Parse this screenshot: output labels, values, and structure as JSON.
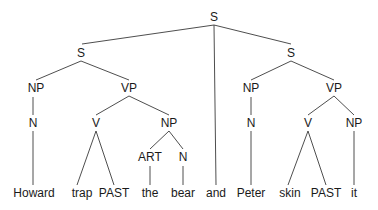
{
  "diagram": {
    "type": "syntax-tree",
    "nodes": [
      {
        "id": "s_root",
        "label": "S",
        "x": 214,
        "y": 21
      },
      {
        "id": "s_left",
        "label": "S",
        "x": 81,
        "y": 57
      },
      {
        "id": "s_right",
        "label": "S",
        "x": 291,
        "y": 57
      },
      {
        "id": "np1",
        "label": "NP",
        "x": 36,
        "y": 92
      },
      {
        "id": "vp1",
        "label": "VP",
        "x": 129,
        "y": 92
      },
      {
        "id": "np3",
        "label": "NP",
        "x": 251,
        "y": 92
      },
      {
        "id": "vp2",
        "label": "VP",
        "x": 334,
        "y": 92
      },
      {
        "id": "n1",
        "label": "N",
        "x": 33,
        "y": 127
      },
      {
        "id": "v1",
        "label": "V",
        "x": 96,
        "y": 127
      },
      {
        "id": "np2",
        "label": "NP",
        "x": 169,
        "y": 127
      },
      {
        "id": "n3",
        "label": "N",
        "x": 251,
        "y": 127
      },
      {
        "id": "v2",
        "label": "V",
        "x": 308,
        "y": 127
      },
      {
        "id": "np4",
        "label": "NP",
        "x": 354,
        "y": 127
      },
      {
        "id": "art",
        "label": "ART",
        "x": 150,
        "y": 161
      },
      {
        "id": "n2",
        "label": "N",
        "x": 183,
        "y": 161
      },
      {
        "id": "w_howard",
        "label": "Howard",
        "x": 34,
        "y": 197
      },
      {
        "id": "w_trap",
        "label": "trap",
        "x": 82,
        "y": 197
      },
      {
        "id": "w_past1",
        "label": "PAST",
        "x": 114,
        "y": 197
      },
      {
        "id": "w_the",
        "label": "the",
        "x": 150,
        "y": 197
      },
      {
        "id": "w_bear",
        "label": "bear",
        "x": 183,
        "y": 197
      },
      {
        "id": "w_and",
        "label": "and",
        "x": 216,
        "y": 197
      },
      {
        "id": "w_peter",
        "label": "Peter",
        "x": 251,
        "y": 197
      },
      {
        "id": "w_skin",
        "label": "skin",
        "x": 290,
        "y": 197
      },
      {
        "id": "w_past2",
        "label": "PAST",
        "x": 326,
        "y": 197
      },
      {
        "id": "w_it",
        "label": "it",
        "x": 354,
        "y": 197
      }
    ],
    "edges": [
      {
        "x1": 214,
        "y1": 25,
        "x2": 82,
        "y2": 44
      },
      {
        "x1": 214,
        "y1": 25,
        "x2": 216,
        "y2": 185
      },
      {
        "x1": 214,
        "y1": 25,
        "x2": 291,
        "y2": 44
      },
      {
        "x1": 81,
        "y1": 61,
        "x2": 36,
        "y2": 80
      },
      {
        "x1": 81,
        "y1": 61,
        "x2": 129,
        "y2": 80
      },
      {
        "x1": 291,
        "y1": 61,
        "x2": 251,
        "y2": 80
      },
      {
        "x1": 291,
        "y1": 61,
        "x2": 334,
        "y2": 80
      },
      {
        "x1": 33,
        "y1": 97,
        "x2": 33,
        "y2": 115
      },
      {
        "x1": 129,
        "y1": 96,
        "x2": 96,
        "y2": 115
      },
      {
        "x1": 129,
        "y1": 96,
        "x2": 169,
        "y2": 115
      },
      {
        "x1": 251,
        "y1": 97,
        "x2": 251,
        "y2": 115
      },
      {
        "x1": 334,
        "y1": 96,
        "x2": 308,
        "y2": 115
      },
      {
        "x1": 334,
        "y1": 96,
        "x2": 354,
        "y2": 115
      },
      {
        "x1": 33,
        "y1": 131,
        "x2": 33,
        "y2": 185
      },
      {
        "x1": 96,
        "y1": 131,
        "x2": 77,
        "y2": 185
      },
      {
        "x1": 96,
        "y1": 131,
        "x2": 114,
        "y2": 185
      },
      {
        "x1": 169,
        "y1": 131,
        "x2": 150,
        "y2": 149
      },
      {
        "x1": 169,
        "y1": 131,
        "x2": 183,
        "y2": 149
      },
      {
        "x1": 150,
        "y1": 166,
        "x2": 150,
        "y2": 185
      },
      {
        "x1": 183,
        "y1": 166,
        "x2": 183,
        "y2": 185
      },
      {
        "x1": 251,
        "y1": 131,
        "x2": 251,
        "y2": 185
      },
      {
        "x1": 308,
        "y1": 131,
        "x2": 288,
        "y2": 185
      },
      {
        "x1": 308,
        "y1": 131,
        "x2": 326,
        "y2": 185
      },
      {
        "x1": 354,
        "y1": 131,
        "x2": 354,
        "y2": 185
      }
    ]
  }
}
